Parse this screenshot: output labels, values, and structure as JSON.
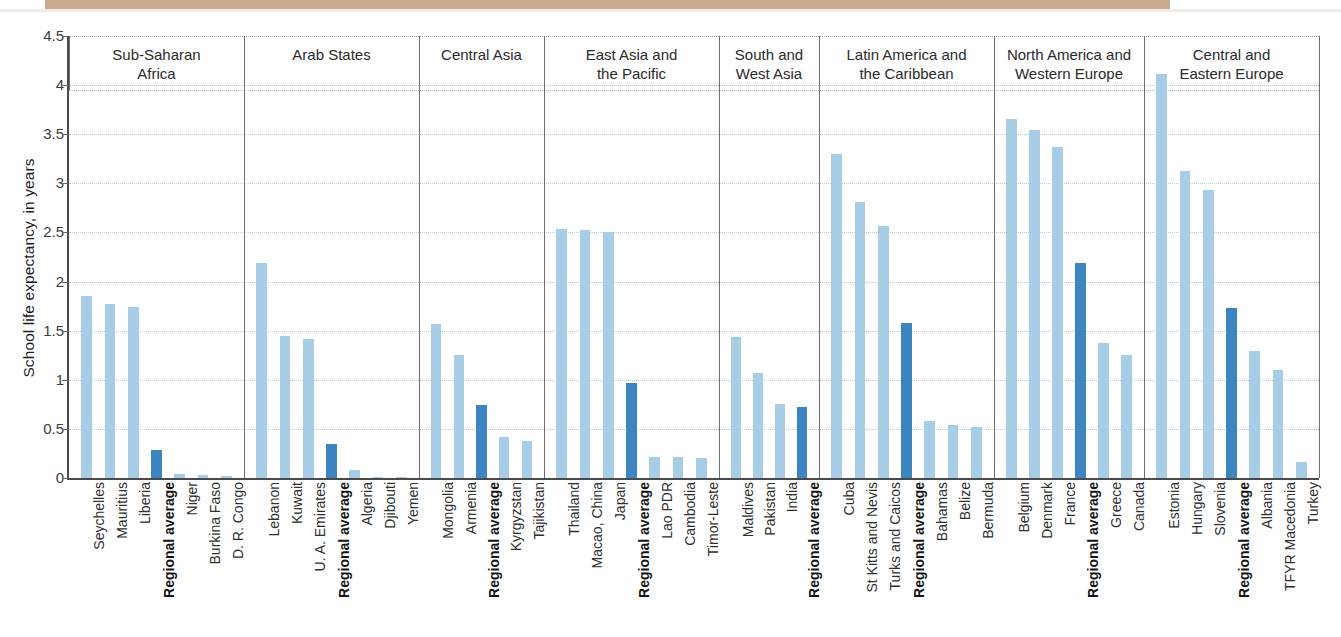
{
  "chart_data": {
    "type": "bar",
    "title": "",
    "xlabel": "",
    "ylabel": "School life expectancy, in years",
    "ylim": [
      0,
      4.5
    ],
    "ytick_labels": [
      "4.5",
      "4",
      "3.5",
      "3",
      "2.5",
      "2",
      "1.5",
      "1",
      "0.5",
      "0"
    ],
    "ytick_values": [
      4.5,
      4,
      3.5,
      3,
      2.5,
      2,
      1.5,
      1,
      0.5,
      0
    ],
    "grid": true,
    "legend_position": "none",
    "colors": {
      "country_bar": "#a8cde6",
      "regional_average_bar": "#3d85c0",
      "gridline": "#9fc5dd",
      "axis": "#4a4a4a"
    },
    "panels": [
      {
        "name": "Sub-Saharan Africa",
        "title_lines": [
          "Sub-Saharan",
          "Africa"
        ],
        "categories": [
          "Seychelles",
          "Mauritius",
          "Liberia",
          "Regional average",
          "Niger",
          "Burkina Faso",
          "D. R. Congo"
        ],
        "values": [
          1.85,
          1.77,
          1.74,
          0.29,
          0.04,
          0.03,
          0.02
        ],
        "highlight_index": 3
      },
      {
        "name": "Arab States",
        "title_lines": [
          "Arab States"
        ],
        "categories": [
          "Lebanon",
          "Kuwait",
          "U. A. Emirates",
          "Regional average",
          "Algeria",
          "Djibouti",
          "Yemen"
        ],
        "values": [
          2.19,
          1.45,
          1.42,
          0.35,
          0.08,
          0.015,
          0.005
        ],
        "highlight_index": 3
      },
      {
        "name": "Central Asia",
        "title_lines": [
          "Central Asia"
        ],
        "categories": [
          "Mongolia",
          "Armenia",
          "Regional average",
          "Kyrgyzstan",
          "Tajikistan"
        ],
        "values": [
          1.57,
          1.25,
          0.74,
          0.42,
          0.38
        ],
        "highlight_index": 2
      },
      {
        "name": "East Asia and the Pacific",
        "title_lines": [
          "East Asia and",
          "the Pacific"
        ],
        "categories": [
          "Thailand",
          "Macao, China",
          "Japan",
          "Regional average",
          "Lao PDR",
          "Cambodia",
          "Timor-Leste"
        ],
        "values": [
          2.54,
          2.53,
          2.5,
          0.97,
          0.21,
          0.21,
          0.2
        ],
        "highlight_index": 3
      },
      {
        "name": "South and West Asia",
        "title_lines": [
          "South and",
          "West Asia"
        ],
        "categories": [
          "Maldives",
          "Pakistan",
          "India",
          "Regional average"
        ],
        "values": [
          1.44,
          1.07,
          0.75,
          0.72
        ],
        "highlight_index": 3
      },
      {
        "name": "Latin America and the Caribbean",
        "title_lines": [
          "Latin America and",
          "the Caribbean"
        ],
        "categories": [
          "Cuba",
          "St Kitts and Nevis",
          "Turks and Caicos",
          "Regional average",
          "Bahamas",
          "Belize",
          "Bermuda"
        ],
        "values": [
          3.3,
          2.81,
          2.57,
          1.58,
          0.58,
          0.54,
          0.52
        ],
        "highlight_index": 3
      },
      {
        "name": "North America and Western Europe",
        "title_lines": [
          "North America and",
          "Western Europe"
        ],
        "categories": [
          "Belgium",
          "Denmark",
          "France",
          "Regional average",
          "Greece",
          "Canada"
        ],
        "values": [
          3.66,
          3.54,
          3.37,
          2.19,
          1.37,
          1.25
        ],
        "highlight_index": 3
      },
      {
        "name": "Central and Eastern Europe",
        "title_lines": [
          "Central and",
          "Eastern Europe"
        ],
        "categories": [
          "Estonia",
          "Hungary",
          "Slovenia",
          "Regional average",
          "Albania",
          "TFYR Macedonia",
          "Turkey"
        ],
        "values": [
          4.11,
          3.13,
          2.93,
          1.73,
          1.29,
          1.1,
          0.16
        ],
        "highlight_index": 3
      }
    ]
  }
}
